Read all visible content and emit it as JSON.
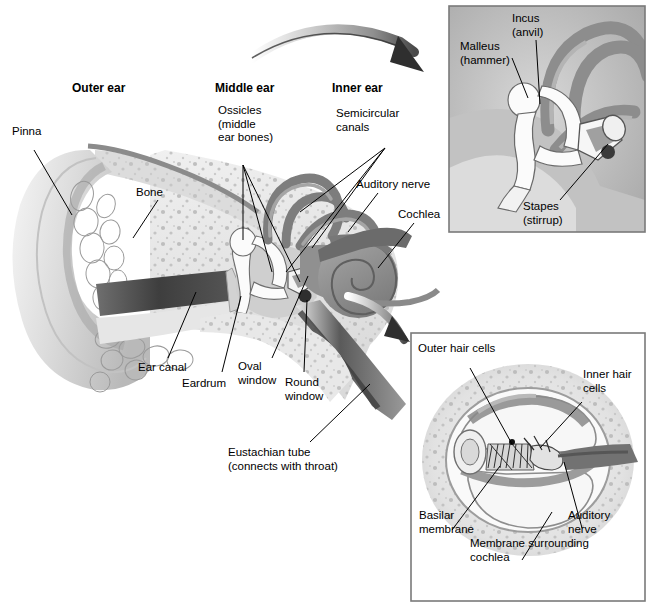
{
  "figure": {
    "background_color": "#ffffff"
  },
  "sections": [
    {
      "name": "outer-ear",
      "label": "Outer ear"
    },
    {
      "name": "middle-ear",
      "label": "Middle ear"
    },
    {
      "name": "inner-ear",
      "label": "Inner ear"
    }
  ],
  "main_labels": [
    {
      "name": "pinna",
      "label": "Pinna"
    },
    {
      "name": "bone",
      "label": "Bone"
    },
    {
      "name": "ossicles",
      "label": "Ossicles\n(middle\near bones)"
    },
    {
      "name": "semicircular-canals",
      "label": "Semicircular\ncanals"
    },
    {
      "name": "auditory-nerve",
      "label": "Auditory nerve"
    },
    {
      "name": "cochlea",
      "label": "Cochlea"
    },
    {
      "name": "ear-canal",
      "label": "Ear canal"
    },
    {
      "name": "eardrum",
      "label": "Eardrum"
    },
    {
      "name": "oval-window",
      "label": "Oval\nwindow"
    },
    {
      "name": "round-window",
      "label": "Round\nwindow"
    },
    {
      "name": "eustachian-tube",
      "label": "Eustachian tube\n(connects with throat)"
    }
  ],
  "inset_top": {
    "name": "ossicles-detail-panel",
    "labels": [
      {
        "name": "malleus",
        "label": "Malleus\n(hammer)"
      },
      {
        "name": "incus",
        "label": "Incus\n(anvil)"
      },
      {
        "name": "stapes",
        "label": "Stapes\n(stirrup)"
      }
    ]
  },
  "inset_bottom": {
    "name": "cochlea-cross-section-panel",
    "labels": [
      {
        "name": "outer-hair-cells",
        "label": "Outer hair cells"
      },
      {
        "name": "inner-hair-cells",
        "label": "Inner hair\ncells"
      },
      {
        "name": "basilar-membrane",
        "label": "Basilar\nmembrane"
      },
      {
        "name": "membrane-surrounding-cochlea",
        "label": "Membrane surrounding\ncochlea"
      },
      {
        "name": "auditory-nerve-inset",
        "label": "Auditory\nnerve"
      }
    ]
  },
  "colors": {
    "ink": "#000000",
    "panel_border": "#7a7a7a",
    "tissue_light": "#ebebeb",
    "tissue_mid": "#c9c9c9",
    "tissue_dark": "#8f8f8f",
    "canal_dark": "#4a4a4a",
    "bone_white": "#fbfbfb"
  }
}
